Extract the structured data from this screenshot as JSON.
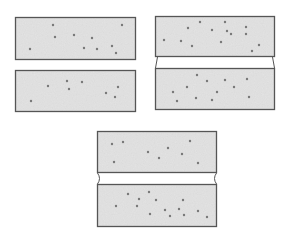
{
  "figure": {
    "background": "#ffffff",
    "block_fill": "#e4e4e4",
    "stroke": "#555555",
    "dot_color": "#777777",
    "panels": [
      {
        "id": "parallel-gap",
        "top_block": {
          "x": 15,
          "y": 17,
          "w": 121,
          "h": 43
        },
        "bottom_block": {
          "x": 15,
          "y": 70,
          "w": 121,
          "h": 42
        },
        "connector": "none",
        "dots_top": [
          [
            53,
            25
          ],
          [
            122,
            25
          ],
          [
            55,
            37
          ],
          [
            74,
            35
          ],
          [
            92,
            38
          ],
          [
            30,
            49
          ],
          [
            84,
            48
          ],
          [
            97,
            49
          ],
          [
            112,
            46
          ],
          [
            116,
            53
          ]
        ],
        "dots_bottom": [
          [
            48,
            86
          ],
          [
            67,
            81
          ],
          [
            69,
            89
          ],
          [
            82,
            82
          ],
          [
            31,
            101
          ],
          [
            106,
            93
          ],
          [
            118,
            87
          ],
          [
            115,
            97
          ]
        ]
      },
      {
        "id": "tapered-gap",
        "top_block": {
          "x": 155,
          "y": 16,
          "w": 120,
          "h": 41
        },
        "bottom_block": {
          "x": 155,
          "y": 68,
          "w": 120,
          "h": 42
        },
        "connector": "diagonal",
        "dots_top": [
          [
            188,
            28
          ],
          [
            200,
            22
          ],
          [
            225,
            22
          ],
          [
            212,
            30
          ],
          [
            227,
            31
          ],
          [
            231,
            34
          ],
          [
            246,
            27
          ],
          [
            246,
            34
          ],
          [
            164,
            40
          ],
          [
            181,
            41
          ],
          [
            221,
            42
          ],
          [
            192,
            46
          ],
          [
            259,
            45
          ],
          [
            252,
            51
          ]
        ],
        "dots_bottom": [
          [
            197,
            75
          ],
          [
            207,
            81
          ],
          [
            225,
            80
          ],
          [
            247,
            79
          ],
          [
            187,
            87
          ],
          [
            234,
            87
          ],
          [
            173,
            92
          ],
          [
            217,
            92
          ],
          [
            196,
            98
          ],
          [
            212,
            100
          ],
          [
            249,
            97
          ],
          [
            177,
            101
          ]
        ]
      },
      {
        "id": "necked-gap",
        "top_block": {
          "x": 97,
          "y": 131,
          "w": 120,
          "h": 42
        },
        "bottom_block": {
          "x": 97,
          "y": 184,
          "w": 120,
          "h": 43
        },
        "connector": "concave",
        "dots_top": [
          [
            112,
            144
          ],
          [
            123,
            142
          ],
          [
            190,
            141
          ],
          [
            148,
            152
          ],
          [
            168,
            148
          ],
          [
            182,
            154
          ],
          [
            159,
            158
          ],
          [
            114,
            162
          ],
          [
            198,
            163
          ]
        ],
        "dots_bottom": [
          [
            128,
            194
          ],
          [
            149,
            192
          ],
          [
            139,
            199
          ],
          [
            156,
            200
          ],
          [
            116,
            206
          ],
          [
            137,
            206
          ],
          [
            183,
            200
          ],
          [
            165,
            210
          ],
          [
            179,
            209
          ],
          [
            150,
            214
          ],
          [
            170,
            216
          ],
          [
            184,
            215
          ],
          [
            198,
            211
          ],
          [
            207,
            217
          ]
        ]
      }
    ]
  }
}
